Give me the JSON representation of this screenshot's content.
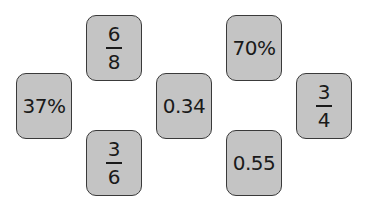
{
  "cards": [
    {
      "id": "card-6-8",
      "type": "fraction",
      "numerator": "6",
      "denominator": "8",
      "x": 86,
      "y": 15
    },
    {
      "id": "card-37pct",
      "type": "value",
      "text": "37%",
      "x": 16,
      "y": 73
    },
    {
      "id": "card-3-6",
      "type": "fraction",
      "numerator": "3",
      "denominator": "6",
      "x": 86,
      "y": 130
    },
    {
      "id": "card-0-34",
      "type": "value",
      "text": "0.34",
      "x": 156,
      "y": 73
    },
    {
      "id": "card-70pct",
      "type": "value",
      "text": "70%",
      "x": 226,
      "y": 15
    },
    {
      "id": "card-3-4",
      "type": "fraction",
      "numerator": "3",
      "denominator": "4",
      "x": 296,
      "y": 73
    },
    {
      "id": "card-0-55",
      "type": "value",
      "text": "0.55",
      "x": 226,
      "y": 130
    }
  ],
  "colors": {
    "card_fill": "#c4c4c4",
    "card_border": "#3a3a3a",
    "text": "#1a1a1a",
    "background": "#ffffff"
  }
}
